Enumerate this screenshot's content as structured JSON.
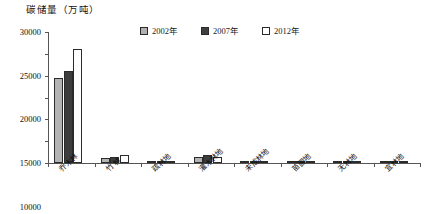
{
  "chart_data": {
    "type": "bar",
    "title": "碳储量（万吨）",
    "xlabel": "",
    "ylabel": "",
    "ylim": [
      0,
      30000
    ],
    "ytick_step": 5000,
    "yticks": [
      "30000",
      "25000",
      "20000",
      "15000",
      "10000",
      "5000",
      "0"
    ],
    "grid": false,
    "legend_position": "top-center",
    "categories": [
      "乔木林",
      "竹 林",
      "疏林地",
      "灌木林地",
      "未成林地",
      "苗圃地",
      "无林地",
      "宜林地"
    ],
    "series": [
      {
        "name": "2002年",
        "color": "#b3b3b3",
        "values": [
          19500,
          1150,
          120,
          1450,
          90,
          40,
          260,
          230
        ]
      },
      {
        "name": "2007年",
        "color": "#3d3d3d",
        "values": [
          21000,
          1400,
          130,
          1750,
          110,
          50,
          300,
          280
        ]
      },
      {
        "name": "2012年",
        "color": "#ffffff",
        "values": [
          26000,
          1900,
          150,
          1300,
          130,
          60,
          200,
          180
        ]
      }
    ]
  },
  "legend": {
    "items": [
      {
        "label": "2002年",
        "swatch": "legend-swatch-2002"
      },
      {
        "label": "2007年",
        "swatch": "legend-swatch-2007"
      },
      {
        "label": "2012年",
        "swatch": "legend-swatch-2012"
      }
    ]
  }
}
